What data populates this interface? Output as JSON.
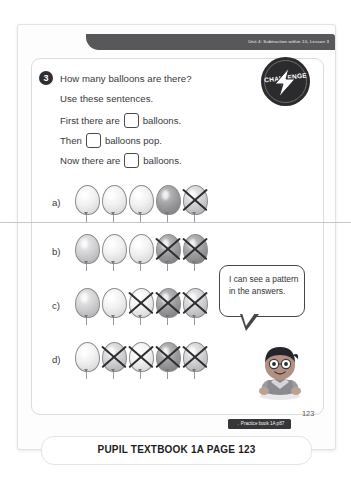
{
  "banner": {
    "unit_text": "Unit 4: Subtraction within 10, Lesson 3"
  },
  "badge": {
    "word": "CHALLENGE",
    "sub": "ZONE",
    "icon": "lightning-bolt-icon"
  },
  "question": {
    "number": "3",
    "title": "How many balloons are there?",
    "instruction": "Use these sentences.",
    "sentences": [
      {
        "before": "First there are",
        "after": "balloons.",
        "value": ""
      },
      {
        "before": "Then",
        "after": "balloons pop.",
        "value": ""
      },
      {
        "before": "Now there are",
        "after": "balloons.",
        "value": ""
      }
    ]
  },
  "balloon_rows": [
    {
      "label": "a)",
      "total": 5,
      "crossed": 1,
      "tones": [
        "light",
        "light",
        "light",
        "dark",
        "medium"
      ]
    },
    {
      "label": "b)",
      "total": 5,
      "crossed": 2,
      "tones": [
        "medium",
        "light",
        "light",
        "dark",
        "dark"
      ]
    },
    {
      "label": "c)",
      "total": 5,
      "crossed": 3,
      "tones": [
        "medium",
        "light",
        "light",
        "dark",
        "medium"
      ]
    },
    {
      "label": "d)",
      "total": 5,
      "crossed": 4,
      "tones": [
        "light",
        "medium",
        "light",
        "dark",
        "medium"
      ]
    }
  ],
  "speech_bubble": {
    "text": "I can see a pattern in the answers."
  },
  "character": {
    "name": "pupil-character"
  },
  "footer": {
    "practice_tag": "→ Practice book 1A p87",
    "page_number": "123"
  },
  "caption": {
    "text": "PUPIL TEXTBOOK 1A  PAGE 123"
  },
  "colors": {
    "banner": "#58585a",
    "badge": "#2b2b2d",
    "ink": "#39393b",
    "tag": "#37373a"
  }
}
